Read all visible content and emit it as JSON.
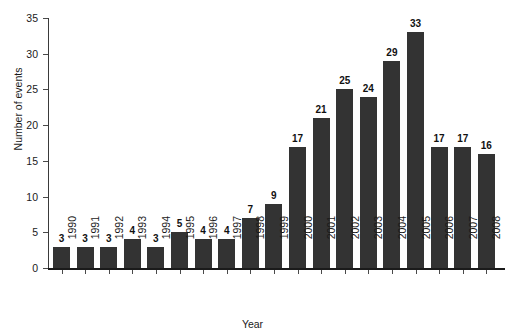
{
  "chart_data": {
    "type": "bar",
    "title": "",
    "xlabel": "Year",
    "ylabel": "Number of events",
    "categories": [
      "1990",
      "1991",
      "1992",
      "1993",
      "1994",
      "1995",
      "1996",
      "1997",
      "1998",
      "1999",
      "2000",
      "2001",
      "2002",
      "2003",
      "2004",
      "2005",
      "2006",
      "2007",
      "2008"
    ],
    "values": [
      3,
      3,
      3,
      4,
      3,
      5,
      4,
      4,
      7,
      9,
      17,
      21,
      25,
      24,
      29,
      33,
      17,
      17,
      16
    ],
    "series": [
      {
        "name": "Number of events",
        "values": [
          3,
          3,
          3,
          4,
          3,
          5,
          4,
          4,
          7,
          9,
          17,
          21,
          25,
          24,
          29,
          33,
          17,
          17,
          16
        ]
      }
    ],
    "data_labels": [
      "3",
      "3",
      "3",
      "4",
      "3",
      "5",
      "4",
      "4",
      "7",
      "9",
      "17",
      "21",
      "25",
      "24",
      "29",
      "33",
      "17",
      "17",
      "16"
    ],
    "ylim": [
      0,
      35
    ],
    "yticks": [
      0,
      5,
      10,
      15,
      20,
      25,
      30,
      35
    ],
    "ytick_labels": [
      "0",
      "5",
      "10",
      "15",
      "20",
      "25",
      "30",
      "35"
    ],
    "grid": false,
    "legend": false,
    "legend_position": "none",
    "bar_color": "#333333",
    "axis_color": "#1a1a1a",
    "background_color": "#ffffff",
    "label_rotation_deg": -90,
    "annotations": []
  },
  "axes": {
    "y_label": "Number of events",
    "x_label": "Year"
  },
  "title_sliver": {
    "text": ""
  }
}
